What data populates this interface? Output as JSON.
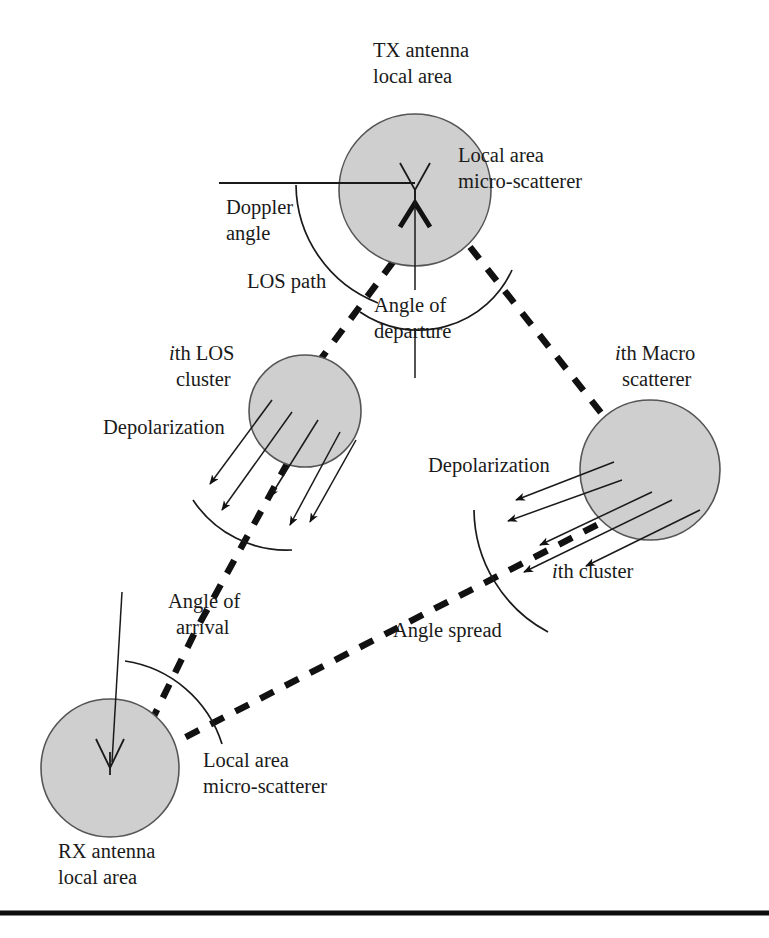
{
  "figure": {
    "background_color": "#ffffff",
    "circle_fill_color": "#cfcfcf",
    "circle_stroke_color": "#555555",
    "ink_color": "#1a1a1a",
    "width": 769,
    "height": 938
  },
  "labels": {
    "tx_antenna_line1": "TX antenna",
    "tx_antenna_line2": "local area",
    "tx_micro_scatterer_line1": "Local area",
    "tx_micro_scatterer_line2": "micro-scatterer",
    "doppler_angle_line1": "Doppler",
    "doppler_angle_line2": "angle",
    "los_path": "LOS path",
    "angle_of_departure_line1": "Angle of",
    "angle_of_departure_line2": "departure",
    "ith_los_cluster_prefix": "i",
    "ith_los_cluster_line1_rest": "th LOS",
    "ith_los_cluster_line2": "cluster",
    "depolarization_left": "Depolarization",
    "ith_macro_scatterer_prefix": "i",
    "ith_macro_scatterer_line1_rest": "th Macro",
    "ith_macro_scatterer_line2": "scatterer",
    "depolarization_right": "Depolarization",
    "ith_cluster_prefix": "i",
    "ith_cluster_rest": "th cluster",
    "angle_spread": "Angle spread",
    "angle_of_arrival_line1": "Angle of",
    "angle_of_arrival_line2": "arrival",
    "rx_micro_scatterer_line1": "Local area",
    "rx_micro_scatterer_line2": "micro-scatterer",
    "rx_antenna_line1": "RX antenna",
    "rx_antenna_line2": "local area"
  },
  "nodes": {
    "tx_circle": {
      "cx": 415,
      "cy": 190,
      "r": 76
    },
    "los_cluster_circle": {
      "cx": 305,
      "cy": 411,
      "r": 56
    },
    "macro_scatterer_circle": {
      "cx": 650,
      "cy": 470,
      "r": 70
    },
    "rx_circle": {
      "cx": 110,
      "cy": 768,
      "r": 69
    }
  },
  "annotations": {
    "doppler_reference_line": "horizontal reference through TX",
    "departure_reference_line": "vertical reference below TX",
    "arrival_reference_line": "vertical reference above RX",
    "dashed_los_branch": "TX to ith LOS cluster to RX",
    "dashed_macro_branch": "TX to ith Macro scatterer to RX",
    "depolarization_arrow_count": 5
  }
}
